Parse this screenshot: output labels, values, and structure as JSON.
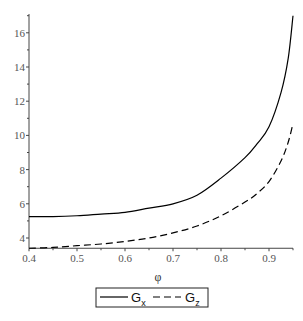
{
  "chart_data": {
    "type": "line",
    "title": "",
    "xlabel": "φ",
    "ylabel": "",
    "xlim": [
      0.4,
      0.95
    ],
    "ylim": [
      3.4,
      17.1
    ],
    "xticks": [
      0.4,
      0.5,
      0.6,
      0.7,
      0.8,
      0.9
    ],
    "xtick_labels": [
      "0.4",
      "0.5",
      "0.6",
      "0.7",
      "0.8",
      "0.9"
    ],
    "yticks": [
      4,
      6,
      8,
      10,
      12,
      14,
      16
    ],
    "ytick_labels": [
      "4",
      "6",
      "8",
      "10",
      "12",
      "14",
      "16"
    ],
    "grid": false,
    "legend_position": "bottom",
    "series": [
      {
        "name": "Gx",
        "label_main": "G",
        "label_sub": "x",
        "style": "solid",
        "color": "#000000",
        "x": [
          0.4,
          0.45,
          0.5,
          0.55,
          0.6,
          0.65,
          0.7,
          0.75,
          0.8,
          0.85,
          0.875,
          0.9,
          0.925,
          0.94,
          0.95
        ],
        "y": [
          5.25,
          5.25,
          5.3,
          5.4,
          5.5,
          5.75,
          6.0,
          6.5,
          7.5,
          8.7,
          9.5,
          10.5,
          12.5,
          14.5,
          17.0
        ]
      },
      {
        "name": "Gz",
        "label_main": "G",
        "label_sub": "z",
        "style": "dashed",
        "color": "#000000",
        "x": [
          0.4,
          0.45,
          0.5,
          0.55,
          0.6,
          0.65,
          0.7,
          0.75,
          0.8,
          0.85,
          0.875,
          0.9,
          0.925,
          0.94,
          0.95
        ],
        "y": [
          3.4,
          3.45,
          3.55,
          3.65,
          3.8,
          4.0,
          4.3,
          4.7,
          5.3,
          6.1,
          6.6,
          7.3,
          8.5,
          9.6,
          10.7
        ]
      }
    ]
  }
}
